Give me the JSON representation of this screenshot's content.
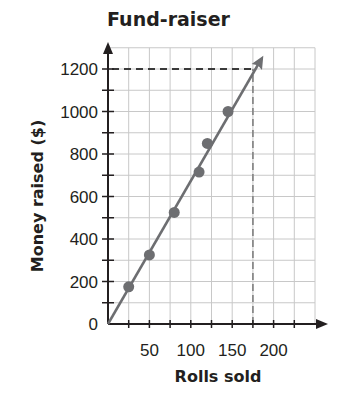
{
  "chart_data": {
    "type": "scatter",
    "title": "Fund-raiser",
    "xlabel": "Rolls sold",
    "ylabel": "Money raised ($)",
    "xlim": [
      0,
      250
    ],
    "ylim": [
      0,
      1300
    ],
    "x_ticks": [
      0,
      50,
      100,
      150,
      200
    ],
    "x_tick_labels": [
      "50",
      "100",
      "150",
      "200"
    ],
    "x_minor_step": 25,
    "y_ticks": [
      0,
      200,
      400,
      600,
      800,
      1000,
      1200
    ],
    "y_tick_labels": [
      "0",
      "200",
      "400",
      "600",
      "800",
      "1000",
      "1200"
    ],
    "y_minor_step": 100,
    "grid": true,
    "series": [
      {
        "name": "Data points",
        "x": [
          25,
          50,
          80,
          110,
          120,
          145
        ],
        "y": [
          175,
          325,
          525,
          715,
          850,
          1000
        ]
      }
    ],
    "trend_line": {
      "from": [
        0,
        0
      ],
      "to": [
        190,
        1300
      ],
      "arrow": true
    },
    "annotations": [
      {
        "type": "dashed-horizontal",
        "y": 1200,
        "x_from": 0,
        "x_to": 175
      },
      {
        "type": "dashed-vertical",
        "x": 175,
        "y_from": 0,
        "y_to": 1200
      }
    ],
    "colors": {
      "axis": "#231f20",
      "grid": "#c8c8c8",
      "line": "#6d6e71",
      "points": "#6d6e71",
      "dash": "#3a3a3a"
    }
  },
  "labels": {
    "title": "Fund-raiser",
    "xlabel": "Rolls sold",
    "ylabel": "Money raised ($)"
  }
}
